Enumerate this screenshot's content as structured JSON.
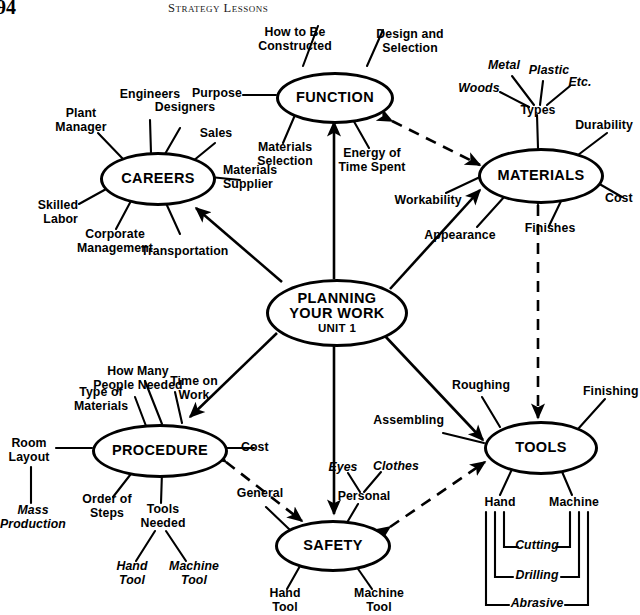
{
  "page": {
    "folio": "94",
    "running_head": "Strategy Lessons"
  },
  "diagram": {
    "type": "concept-map",
    "center": {
      "line1": "PLANNING",
      "line2": "YOUR WORK",
      "line3": "UNIT 1"
    },
    "hubs": [
      {
        "id": "function",
        "label": "FUNCTION"
      },
      {
        "id": "materials",
        "label": "MATERIALS"
      },
      {
        "id": "careers",
        "label": "CAREERS"
      },
      {
        "id": "procedure",
        "label": "PROCEDURE"
      },
      {
        "id": "tools",
        "label": "TOOLS"
      },
      {
        "id": "safety",
        "label": "SAFETY"
      }
    ],
    "labels": {
      "how_to_be_constructed": "How to Be\nConstructed",
      "design_and_selection": "Design and\nSelection",
      "purpose": "Purpose",
      "materials_selection": "Materials\nSelection",
      "energy_of_time_spent": "Energy of\nTime Spent",
      "metal": "Metal",
      "plastic": "Plastic",
      "woods": "Woods",
      "etc": "Etc.",
      "types": "Types",
      "durability": "Durability",
      "cost_materials": "Cost",
      "finishes": "Finishes",
      "appearance": "Appearance",
      "workability": "Workability",
      "engineers": "Engineers",
      "plant_manager": "Plant\nManager",
      "designers": "Designers",
      "sales": "Sales",
      "materials_supplier": "Materials\nSupplier",
      "skilled_labor": "Skilled\nLabor",
      "corporate_management": "Corporate\nManagement",
      "transportation": "Transportation",
      "how_many_people_needed": "How Many\nPeople Needed",
      "time_on_work": "Time on\nWork",
      "type_of_materials": "Type of\nMaterials",
      "room_layout": "Room\nLayout",
      "mass_production": "Mass\nProduction",
      "cost_procedure": "Cost",
      "order_of_steps": "Order of\nSteps",
      "tools_needed": "Tools\nNeeded",
      "hand_tool_procedure": "Hand\nTool",
      "machine_tool_procedure": "Machine\nTool",
      "general": "General",
      "personal": "Personal",
      "eyes": "Eyes",
      "clothes": "Clothes",
      "hand_tool_safety": "Hand\nTool",
      "machine_tool_safety": "Machine\nTool",
      "roughing": "Roughing",
      "assembling": "Assembling",
      "finishing": "Finishing",
      "hand": "Hand",
      "machine": "Machine",
      "cutting": "Cutting",
      "drilling": "Drilling",
      "abrasive": "Abrasive"
    },
    "colors": {
      "ink": "#000000",
      "paper": "#ffffff"
    }
  }
}
